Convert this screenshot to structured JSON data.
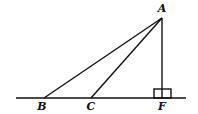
{
  "diagram": {
    "points": {
      "A": {
        "label": "A",
        "x": 162,
        "y": 18
      },
      "B": {
        "label": "B",
        "x": 44,
        "y": 98
      },
      "C": {
        "label": "C",
        "x": 91,
        "y": 98
      },
      "F": {
        "label": "F",
        "x": 162,
        "y": 98
      }
    },
    "baseline": {
      "x1": 16,
      "x2": 186,
      "y": 98
    },
    "segments": [
      [
        "A",
        "B"
      ],
      [
        "A",
        "C"
      ],
      [
        "A",
        "F"
      ]
    ],
    "right_angle_at": "F",
    "labels": {
      "A": "A",
      "B": "B",
      "C": "C",
      "F": "F"
    }
  }
}
